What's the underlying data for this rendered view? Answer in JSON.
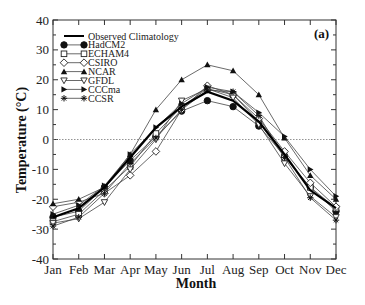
{
  "chart_data": {
    "type": "line",
    "title": "",
    "panel_label": "(a)",
    "xlabel": "Month",
    "ylabel": "Temperature (°C)",
    "ylim": [
      -40,
      40
    ],
    "yticks": [
      -40,
      -30,
      -20,
      -10,
      0,
      10,
      20,
      30,
      40
    ],
    "categories": [
      "Jan",
      "Feb",
      "Mar",
      "Apr",
      "May",
      "Jun",
      "Jul",
      "Aug",
      "Sep",
      "Oct",
      "Nov",
      "Dec"
    ],
    "grid": false,
    "reference_line": {
      "y": 0,
      "style": "dotted"
    },
    "legend_position": "upper-left",
    "series": [
      {
        "name": "Observed Climatology",
        "marker": "none",
        "line": "thick",
        "values": [
          -26,
          -23,
          -16,
          -6,
          4,
          11,
          16,
          13,
          6,
          -5,
          -17,
          -23
        ]
      },
      {
        "name": "HadCM2",
        "marker": "filled-circle",
        "values": [
          -26,
          -24,
          -16,
          -7,
          1,
          9.5,
          13,
          11,
          4.5,
          -5.5,
          -16,
          -24
        ]
      },
      {
        "name": "ECHAM4",
        "marker": "open-square",
        "values": [
          -27.5,
          -25,
          -17,
          -9,
          2,
          11,
          17,
          15,
          6,
          -6,
          -16,
          -23
        ]
      },
      {
        "name": "CSIRO",
        "marker": "open-diamond",
        "values": [
          -22.5,
          -21,
          -18,
          -12,
          -4,
          10,
          18,
          15,
          7,
          -4,
          -14.5,
          -22.5
        ]
      },
      {
        "name": "NCAR",
        "marker": "filled-triangle-up",
        "values": [
          -21.5,
          -20,
          -16,
          -5,
          10,
          20,
          25,
          23,
          15,
          0.5,
          -12,
          -20
        ]
      },
      {
        "name": "GFDL",
        "marker": "open-triangle-down",
        "values": [
          -28,
          -26.5,
          -21,
          -10,
          0,
          13,
          17,
          14,
          5,
          -8,
          -19,
          -26
        ]
      },
      {
        "name": "CCCma",
        "marker": "filled-triangle-right",
        "values": [
          -25,
          -22,
          -15.5,
          -5,
          4,
          12,
          17.5,
          16,
          9,
          1,
          -10,
          -19
        ]
      },
      {
        "name": "CCSR",
        "marker": "asterisk",
        "values": [
          -29,
          -26,
          -18,
          -8,
          0.5,
          10,
          16.5,
          16,
          8,
          -6,
          -19.5,
          -27
        ]
      }
    ]
  }
}
